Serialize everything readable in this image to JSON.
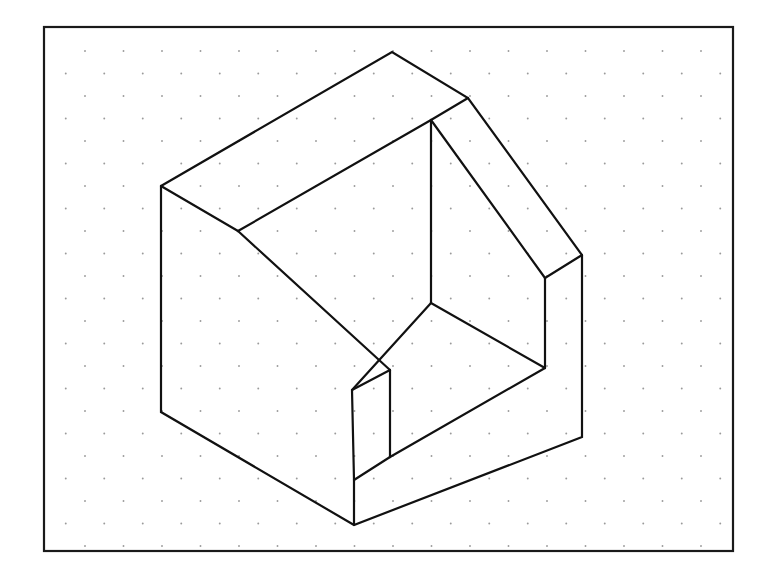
{
  "canvas": {
    "width": 782,
    "height": 586,
    "background_color": "#ffffff"
  },
  "frame": {
    "name": "drawing-border",
    "x": 44,
    "y": 27,
    "width": 689,
    "height": 524,
    "stroke_color": "#1a1a1a",
    "stroke_width": 2.2,
    "fill": "none"
  },
  "grid": {
    "type": "isometric-dot-grid",
    "dot_color": "#9a9a9a",
    "dot_radius": 0.95,
    "column_spacing": 38.5,
    "row_spacing": 22.5,
    "origin_x": 85,
    "origin_y": 51,
    "columns": 18,
    "rows": 23,
    "description": "staggered dot grid filling the bordered drawing area"
  },
  "drawing": {
    "title": "Isometric projection of a notched block with sloped ramp",
    "stroke_color": "#111111",
    "stroke_width": 2.2,
    "fill": "none",
    "line_join": "miter",
    "vertices": {
      "top_apex": [
        392,
        52
      ],
      "top_right_notch": [
        468,
        98
      ],
      "left_top_corner": [
        161,
        186
      ],
      "top_face_junction": [
        238,
        231
      ],
      "right_outer_top": [
        582,
        255
      ],
      "right_inner_top": [
        545,
        278
      ],
      "inner_back_top": [
        431,
        120
      ],
      "inner_back_floor": [
        431,
        303
      ],
      "inner_floor_right": [
        545,
        368
      ],
      "ramp_band_inner_top": [
        432,
        333
      ],
      "ramp_band_bottom_left": [
        352,
        390
      ],
      "ramp_foot_top": [
        390,
        370
      ],
      "ramp_foot_bottom": [
        390,
        457
      ],
      "bottom_front": [
        354,
        525
      ],
      "left_bottom_corner": [
        161,
        412
      ],
      "right_outer_bottom": [
        582,
        437
      ],
      "front_left_base": [
        354,
        480
      ]
    },
    "paths": [
      {
        "name": "outer-silhouette",
        "d": "M 161 186 L 392 52 L 468 98 L 582 255 L 582 437 L 354 525 L 161 412 Z"
      },
      {
        "name": "top-face-left-edge",
        "d": "M 161 186 L 238 231"
      },
      {
        "name": "top-face-ridge",
        "d": "M 238 231 L 431 120"
      },
      {
        "name": "inner-back-vertical",
        "d": "M 431 120 L 431 303"
      },
      {
        "name": "notch-top-right-edge",
        "d": "M 431 120 L 468 98"
      },
      {
        "name": "inner-right-slope",
        "d": "M 431 120 L 545 278"
      },
      {
        "name": "right-inner-vertical",
        "d": "M 545 278 L 545 368"
      },
      {
        "name": "right-inner-to-outer",
        "d": "M 545 278 L 582 255"
      },
      {
        "name": "inner-floor-left-edge",
        "d": "M 431 303 L 352 390"
      },
      {
        "name": "inner-floor-right-edge",
        "d": "M 431 303 L 545 368"
      },
      {
        "name": "ramp-band-inner-edge",
        "d": "M 238 231 L 390 370"
      },
      {
        "name": "ramp-band-lower-edge",
        "d": "M 352 390 L 390 370"
      },
      {
        "name": "ramp-foot-vertical",
        "d": "M 390 370 L 390 457"
      },
      {
        "name": "ramp-foot-base-edge",
        "d": "M 390 457 L 545 368"
      },
      {
        "name": "front-left-vertical",
        "d": "M 354 480 L 354 525"
      },
      {
        "name": "front-left-base-edge",
        "d": "M 354 480 L 390 457"
      },
      {
        "name": "ramp-band-outer-lower",
        "d": "M 352 390 L 354 480"
      }
    ]
  }
}
